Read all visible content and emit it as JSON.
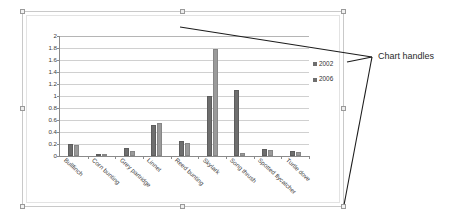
{
  "annotation": {
    "label": "Chart handles"
  },
  "legend": {
    "position": "right",
    "entries": [
      {
        "label": "2002",
        "color": "#6e6e6e",
        "marker": "square-marker"
      },
      {
        "label": "2006",
        "color": "#6e6e6e",
        "marker": "square-marker"
      }
    ]
  },
  "handles": {
    "names": [
      "handle-top-left",
      "handle-top-center",
      "handle-top-right",
      "handle-middle-left",
      "handle-middle-right",
      "handle-bottom-left",
      "handle-bottom-center",
      "handle-bottom-right"
    ]
  },
  "chart_data": {
    "type": "bar",
    "title": "",
    "subtitle": "",
    "xlabel": "",
    "ylabel": "",
    "ylim": [
      0,
      2
    ],
    "yticks": [
      0,
      0.2,
      0.4,
      0.6,
      0.8,
      1,
      1.2,
      1.4,
      1.6,
      1.8,
      2
    ],
    "ytick_labels": [
      "0",
      "0.2",
      "0.4",
      "0.6",
      "0.8",
      "1",
      "1.2",
      "1.4",
      "1.6",
      "1.8",
      "2"
    ],
    "grid": true,
    "legend_position": "right",
    "categories": [
      "Bullfinch",
      "Corn bunting",
      "Grey partridge",
      "Linnet",
      "Reed bunting",
      "Skylark",
      "Song thrush",
      "Spotted flycatcher",
      "Turtle dove"
    ],
    "series": [
      {
        "name": "2002",
        "color": "#6e6e6e",
        "values": [
          0.2,
          0.02,
          0.14,
          0.52,
          0.25,
          1.0,
          1.1,
          0.12,
          0.08
        ]
      },
      {
        "name": "2006",
        "color": "#9a9a9a",
        "values": [
          0.18,
          0.02,
          0.08,
          0.55,
          0.21,
          1.78,
          0.05,
          0.1,
          0.06
        ]
      }
    ]
  }
}
